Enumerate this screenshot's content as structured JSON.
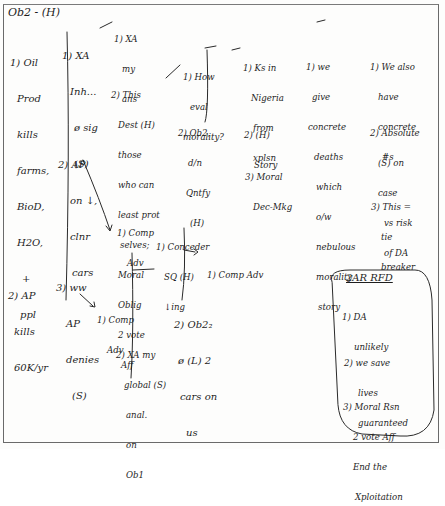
{
  "page": {
    "title": "Ob2 - (H)"
  },
  "columns": {
    "first": [
      {
        "id": "oil",
        "lines": [
          "1) Oil",
          "Prod",
          "kills",
          "farms,",
          "BioD,",
          "H2O,",
          "+",
          "ppl"
        ]
      },
      {
        "id": "ap-kills",
        "lines": [
          "2) AP",
          "kills",
          "60K/yr"
        ]
      }
    ],
    "second": [
      {
        "id": "xa-inh",
        "lines": [
          "1) XA",
          "Inh...",
          "ø sig",
          "(S)"
        ]
      },
      {
        "id": "ap-on",
        "lines": [
          "2) AP",
          "on ↓,",
          "clnr",
          "cars"
        ]
      },
      {
        "id": "ww-ap",
        "lines": [
          "3) ww",
          "AP",
          "denies",
          "(S)"
        ]
      }
    ],
    "third": [
      {
        "id": "xa-my-ans",
        "lines": [
          "1) XA",
          "my",
          "ans"
        ]
      },
      {
        "id": "this-dest",
        "lines": [
          "2) This",
          "Dest (H)",
          "those",
          "who can",
          "least prot",
          "selves;",
          "Moral",
          "Oblig",
          "2 vote",
          "Aff"
        ]
      },
      {
        "id": "comp-adv-1",
        "lines": [
          "1) Comp",
          "Adv"
        ]
      },
      {
        "id": "comp-adv-2",
        "lines": [
          "1) Comp",
          "Adv"
        ]
      },
      {
        "id": "xa-global",
        "lines": [
          "2) XA my",
          "global (S)",
          "anal.",
          "on",
          "Ob1"
        ]
      }
    ],
    "fourth": [
      {
        "id": "how-eval",
        "lines": [
          "1) How",
          "eval",
          "morality?"
        ]
      },
      {
        "id": "ob2-dn",
        "lines": [
          "2) Ob2,",
          "d/n",
          "Qntfy",
          "(H)"
        ]
      },
      {
        "id": "concede",
        "lines": [
          "1) Conceder",
          "SQ (H)",
          "↓ing"
        ]
      },
      {
        "id": "ob2-cars",
        "lines": [
          "2) Ob2₂",
          "ø (L) 2",
          "cars on",
          "us"
        ]
      }
    ],
    "fifth": [
      {
        "id": "ks-nigeria",
        "lines": [
          "1) Ks in",
          "Nigeria",
          "from",
          "xplsn"
        ]
      },
      {
        "id": "h-story",
        "lines": [
          "2) (H)",
          "Story"
        ]
      },
      {
        "id": "moral-dec",
        "lines": [
          "3) Moral",
          "Dec-Mkg"
        ]
      },
      {
        "id": "comp-adv-3",
        "lines": [
          "1) Comp Adv"
        ]
      }
    ],
    "sixth": [
      {
        "id": "we-give",
        "lines": [
          "1) we",
          "give",
          "concrete",
          "deaths",
          "which",
          "o/w",
          "nebulous",
          "morality",
          "story"
        ]
      }
    ],
    "seventh": [
      {
        "id": "we-also",
        "lines": [
          "1) We also",
          "have",
          "concrete",
          "#s"
        ]
      },
      {
        "id": "absolute",
        "lines": [
          "2) Absolute",
          "(S) on",
          "case",
          "vs risk",
          "of DA"
        ]
      },
      {
        "id": "tie-breaker",
        "lines": [
          "3) This =",
          "tie",
          "breaker"
        ]
      }
    ]
  },
  "rfd_box": {
    "heading": "2AR RFD",
    "items": [
      {
        "lines": [
          "1) DA",
          "unlikely"
        ]
      },
      {
        "lines": [
          "2) we save",
          "lives",
          "guaranteed"
        ]
      },
      {
        "lines": [
          "3) Moral Rsn",
          "2 vote Aff",
          "End the",
          "Xploitation"
        ]
      }
    ]
  },
  "colors": {
    "ink": "#1e1e1e",
    "border": "#6a6a6a",
    "paper": "#fdfdfc"
  }
}
